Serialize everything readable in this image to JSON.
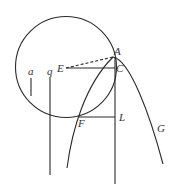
{
  "diagram": {
    "labels": {
      "A": "A",
      "C": "C",
      "E": "E",
      "F": "F",
      "L": "L",
      "G": "G",
      "a": "a",
      "q": "q"
    },
    "colors": {
      "stroke": "#2a2a2a",
      "text": "#333333",
      "background": "#ffffff"
    },
    "elements": [
      "circle through A and F",
      "parabola with vertex near A",
      "dashed segment EA",
      "segment EC",
      "segment FL",
      "vertical line through A, C, L",
      "vertical line q",
      "short segment a"
    ]
  }
}
